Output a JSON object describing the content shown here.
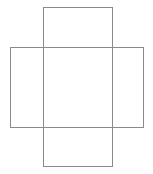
{
  "canvas": {
    "width": 153,
    "height": 174,
    "background_color": "#ffffff",
    "title": ""
  },
  "chart_data": {
    "type": "diagram",
    "title": "",
    "xlabel": "",
    "ylabel": "",
    "grid": false,
    "legend": false,
    "xlim": [
      0,
      153
    ],
    "ylim": [
      0,
      174
    ],
    "shapes": [
      {
        "name": "vertical-rectangle",
        "type": "rect",
        "x": 43,
        "y": 7,
        "width": 69,
        "height": 159,
        "stroke": "#8a8a8a",
        "stroke_width": 1,
        "fill": "none"
      },
      {
        "name": "horizontal-rectangle",
        "type": "rect",
        "x": 10,
        "y": 47,
        "width": 133,
        "height": 80,
        "stroke": "#8a8a8a",
        "stroke_width": 1,
        "fill": "none"
      }
    ],
    "labels": [],
    "annotations": []
  }
}
